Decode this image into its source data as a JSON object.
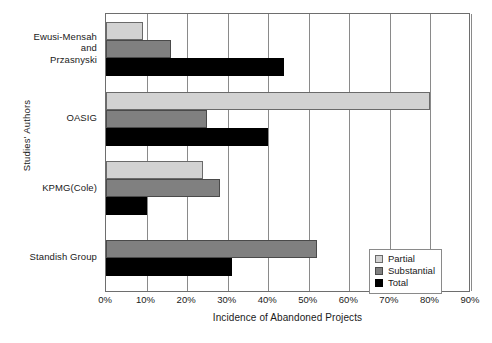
{
  "chart_data": {
    "type": "bar",
    "orientation": "horizontal",
    "title": "",
    "xlabel": "Incidence of Abandoned Projects",
    "ylabel": "Studies' Authors",
    "categories": [
      "Ewusi-Mensah and Przasnyski",
      "OASIG",
      "KPMG(Cole)",
      "Standish Group"
    ],
    "series": [
      {
        "name": "Partial",
        "color": "#d2d2d2",
        "values": [
          9,
          80,
          24,
          null
        ]
      },
      {
        "name": "Substantial",
        "color": "#808080",
        "values": [
          16,
          25,
          28,
          52
        ]
      },
      {
        "name": "Total",
        "color": "#000000",
        "values": [
          44,
          40,
          10,
          31
        ]
      }
    ],
    "xlim": [
      0,
      90
    ],
    "xticks": [
      "0%",
      "10%",
      "20%",
      "30%",
      "40%",
      "50%",
      "60%",
      "70%",
      "80%",
      "90%"
    ],
    "xtick_values": [
      0,
      10,
      20,
      30,
      40,
      50,
      60,
      70,
      80,
      90
    ],
    "grid": true,
    "grid_axis": "x",
    "legend_position": "bottom-right"
  },
  "axes": {
    "y_title": "Studies' Authors",
    "x_title": "Incidence of Abandoned Projects",
    "category_labels": [
      [
        "Ewusi-Mensah",
        "and",
        "Przasnyski"
      ],
      [
        "OASIG"
      ],
      [
        "KPMG(Cole)"
      ],
      [
        "Standish Group"
      ]
    ]
  },
  "legend": {
    "items": [
      {
        "label": "Partial",
        "key": "partial"
      },
      {
        "label": "Substantial",
        "key": "substantial"
      },
      {
        "label": "Total",
        "key": "total"
      }
    ]
  }
}
